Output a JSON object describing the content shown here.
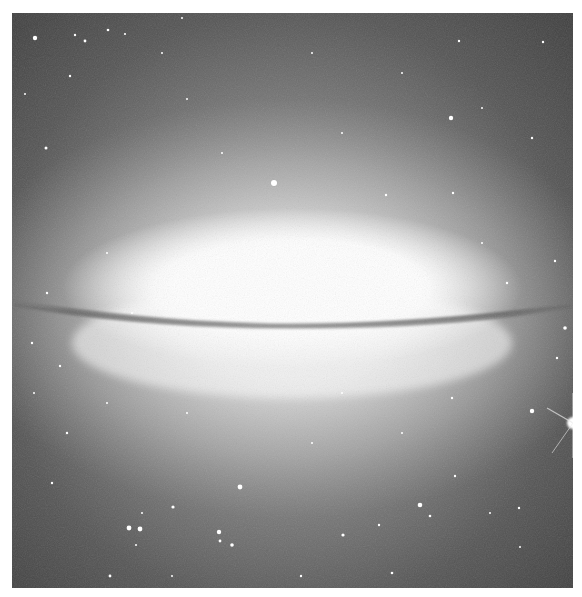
{
  "image": {
    "subject": "edge-on spiral galaxy with dark dust lane (Sombrero-like)",
    "alt": "Grayscale astronomical photograph of an edge-on galaxy with a bright central bulge, a dark dust lane, and a surrounding star field",
    "colors": {
      "background": "#ffffff",
      "sky_dark": "#3a3a3a",
      "sky_mid": "#6e6e6e",
      "halo": "#bdbdbd",
      "core": "#ffffff",
      "dust_lane": "#7a7a7a"
    }
  }
}
